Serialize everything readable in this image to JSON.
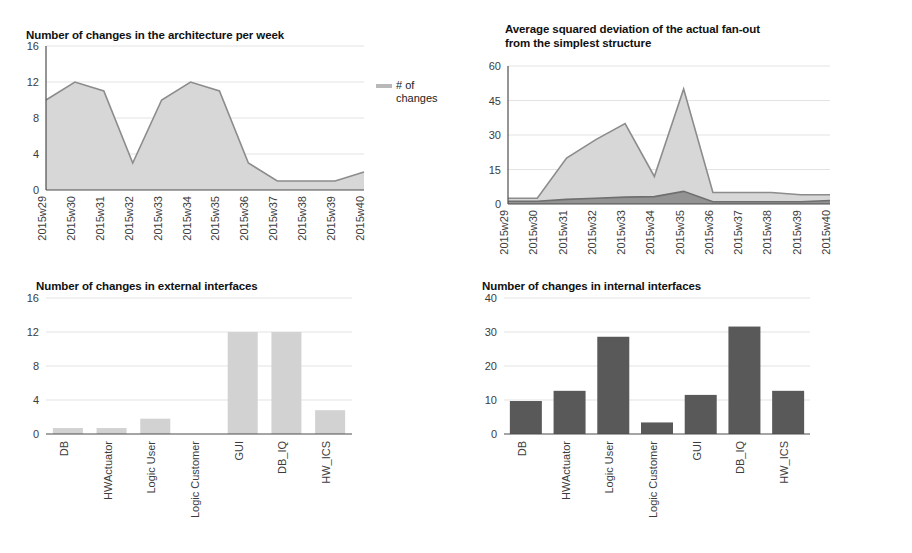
{
  "page": {
    "background": "#ffffff",
    "accent_light": "#d5d5d5",
    "accent_dark": "#5a5a5a",
    "line_color": "#8c8c8c",
    "grid_color": "#e3e3e3"
  },
  "charts": [
    {
      "id": "architecture-changes",
      "title": "Number of changes in the architecture per week",
      "legend": [
        {
          "label": "# of\nchanges",
          "color": "#b9b9b9",
          "swatch": "line"
        }
      ],
      "chart_data": {
        "type": "area",
        "title": "Number of changes in the architecture per week",
        "xlabel": "",
        "ylabel": "",
        "ylim": [
          0,
          16
        ],
        "yticks": [
          0,
          4,
          8,
          12,
          16
        ],
        "grid": true,
        "legend_position": "right",
        "categories": [
          "2015w29",
          "2015w30",
          "2015w31",
          "2015w32",
          "2015w33",
          "2015w34",
          "2015w35",
          "2015w36",
          "2015w37",
          "2015w38",
          "2015w39",
          "2015w40"
        ],
        "series": [
          {
            "name": "# of changes",
            "color": "#d5d5d5",
            "values": [
              10,
              12,
              11,
              3,
              10,
              12,
              11,
              3,
              1,
              1,
              1,
              2
            ]
          }
        ]
      }
    },
    {
      "id": "fanout-deviation",
      "title": "Average squared deviation of the actual fan-out\nfrom the simplest structure",
      "legend": [
        {
          "label": "avg.\ndeviat...",
          "color": "#c4c4c4",
          "swatch": "line"
        },
        {
          "label": "average",
          "color": "#8f8f8f",
          "swatch": "line"
        }
      ],
      "chart_data": {
        "type": "area",
        "title": "Average squared deviation of the actual fan-out from the simplest structure",
        "xlabel": "",
        "ylabel": "",
        "ylim": [
          0,
          60
        ],
        "yticks": [
          0,
          15,
          30,
          45,
          60
        ],
        "grid": true,
        "legend_position": "right",
        "categories": [
          "2015w29",
          "2015w30",
          "2015w31",
          "2015w32",
          "2015w33",
          "2015w34",
          "2015w35",
          "2015w36",
          "2015w37",
          "2015w38",
          "2015w39",
          "2015w40"
        ],
        "series": [
          {
            "name": "avg. deviat...",
            "color": "#d5d5d5",
            "values": [
              2.5,
              2.5,
              20,
              28,
              35,
              12,
              50,
              5,
              5,
              5,
              4,
              4
            ]
          },
          {
            "name": "average",
            "color": "#8f8f8f",
            "values": [
              1.2,
              1.2,
              2,
              2.5,
              3,
              3.2,
              5.5,
              1,
              1,
              1,
              1,
              1.5
            ]
          }
        ]
      }
    },
    {
      "id": "external-interface-changes",
      "title": "Number of changes in external interfaces",
      "legend": [
        {
          "label": "Interf...",
          "color": "#6e6e6e",
          "swatch": "block"
        }
      ],
      "chart_data": {
        "type": "bar",
        "title": "Number of changes in external interfaces",
        "xlabel": "",
        "ylabel": "",
        "ylim": [
          0,
          16
        ],
        "yticks": [
          0,
          4,
          8,
          12,
          16
        ],
        "grid": true,
        "legend_position": "right",
        "categories": [
          "DB",
          "HWActuator",
          "Logic User",
          "Logic Customer",
          "GUI",
          "DB_IQ",
          "HW_ICS"
        ],
        "series": [
          {
            "name": "Interf...",
            "color": "#d2d2d2",
            "values": [
              0.7,
              0.7,
              1.8,
              0,
              12,
              12,
              2.8
            ]
          }
        ]
      }
    },
    {
      "id": "internal-interface-changes",
      "title": "Number of changes in internal interfaces",
      "legend": [
        {
          "label": "Chan...",
          "color": "#6e6e6e",
          "swatch": "block"
        }
      ],
      "chart_data": {
        "type": "bar",
        "title": "Number of changes in internal interfaces",
        "xlabel": "",
        "ylabel": "",
        "ylim": [
          0,
          40
        ],
        "yticks": [
          0,
          10,
          20,
          30,
          40
        ],
        "grid": true,
        "legend_position": "right",
        "categories": [
          "DB",
          "HWActuator",
          "Logic User",
          "Logic Customer",
          "GUI",
          "DB_IQ",
          "HW_ICS"
        ],
        "series": [
          {
            "name": "Chan...",
            "color": "#595959",
            "values": [
              9.7,
              12.7,
              28.6,
              3.4,
              11.5,
              31.6,
              12.7
            ]
          }
        ]
      }
    }
  ]
}
